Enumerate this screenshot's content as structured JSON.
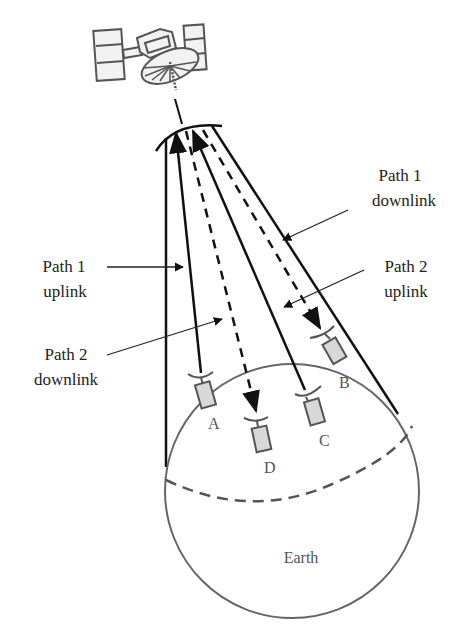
{
  "diagram": {
    "labels": {
      "path1_downlink": [
        "Path 1",
        "downlink"
      ],
      "path1_uplink": [
        "Path 1",
        "uplink"
      ],
      "path2_uplink": [
        "Path 2",
        "uplink"
      ],
      "path2_downlink": [
        "Path 2",
        "downlink"
      ],
      "earth": "Earth"
    },
    "stations": [
      {
        "id": "A",
        "label": "A"
      },
      {
        "id": "B",
        "label": "B"
      },
      {
        "id": "C",
        "label": "C"
      },
      {
        "id": "D",
        "label": "D"
      }
    ],
    "links": [
      {
        "name": "Path 1 uplink",
        "from": "A",
        "to": "satellite",
        "style": "solid"
      },
      {
        "name": "Path 2 downlink",
        "from": "satellite",
        "to": "D",
        "style": "dashed"
      },
      {
        "name": "Path 1 downlink",
        "from": "C",
        "to": "satellite",
        "style": "solid"
      },
      {
        "name": "Path 2 uplink",
        "from": "satellite",
        "to": "B",
        "style": "dashed"
      }
    ],
    "colors": {
      "line": "#111111",
      "earth_outline": "#666666",
      "station_fill": "#d8d8d8"
    }
  }
}
